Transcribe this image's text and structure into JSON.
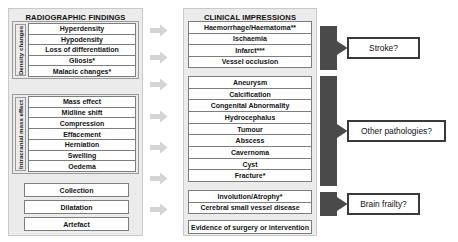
{
  "columns": {
    "left": {
      "title": "RADIOGRAPHIC FINDINGS",
      "groups": [
        {
          "label": "Density changes",
          "items": [
            "Hyperdensity",
            "Hypodensity",
            "Loss of differentiation",
            "Gliosis*",
            "Malacic changes*"
          ]
        },
        {
          "label": "Intracranial mass effect",
          "items": [
            "Mass effect",
            "Midline shift",
            "Compression",
            "Effacement",
            "Herniation",
            "Swelling",
            "Oedema"
          ]
        }
      ],
      "standalone": [
        "Collection",
        "Dilatation",
        "Artefact"
      ]
    },
    "middle": {
      "title": "CLINICAL IMPRESSIONS",
      "group_a": [
        "Haemorrhage/Haematoma**",
        "Ischaemia",
        "Infarct***",
        "Vessel occlusion"
      ],
      "group_b": [
        "Aneurysm",
        "Calcification",
        "Congenital Abnormality",
        "Hydrocephalus",
        "Tumour",
        "Abscess",
        "Cavernoma",
        "Cyst",
        "Fracture*"
      ],
      "group_c": [
        "Involution/Atrophy*",
        "Cerebral small vessel disease"
      ],
      "standalone": [
        "Evidence of surgery or intervention"
      ]
    },
    "right": {
      "outcomes": [
        "Stroke?",
        "Other pathologies?",
        "Brain frailty?"
      ]
    }
  },
  "connectors": {
    "light_arrow_count": 7,
    "light_arrow_color": "#d4d4d4",
    "dark_block_color": "#4a4a4a",
    "dark_block_count": 3
  },
  "colors": {
    "page_background": "#ffffff",
    "panel_background": "#ebebeb",
    "item_background": "#ffffff",
    "item_border": "#7d7d7d",
    "outcome_border": "#3a3a3a",
    "text": "#141414"
  }
}
